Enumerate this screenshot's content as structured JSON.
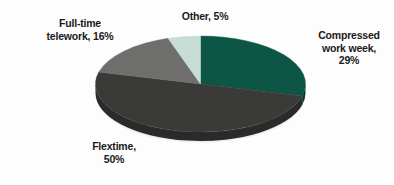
{
  "chart_data": {
    "type": "pie",
    "title": "",
    "subtitle": "",
    "xlabel": "",
    "ylabel": "",
    "legend_position": "none",
    "grid": false,
    "style": "3d-pie",
    "background_color": "#fdfdfd",
    "label_color": "#1a1a1a",
    "start_angle_deg": 0,
    "direction": "clockwise",
    "categories": [
      "Compressed work week",
      "Flextime",
      "Full-time telework",
      "Other"
    ],
    "values": [
      29,
      50,
      16,
      5
    ],
    "value_unit": "%",
    "colors": [
      "#0d5544",
      "#3a3a38",
      "#6e6e6c",
      "#c8dcd6"
    ],
    "side_colors": [
      "#083b30",
      "#2a2a28",
      "#4f4f4d",
      "#9fb3ad"
    ],
    "slices": [
      {
        "name": "Compressed work week",
        "value": 29,
        "label": "Compressed\nwork week,\n29%",
        "color": "#0d5544",
        "side_color": "#083b30"
      },
      {
        "name": "Flextime",
        "value": 50,
        "label": "Flextime,\n50%",
        "color": "#3a3a38",
        "side_color": "#2a2a28"
      },
      {
        "name": "Full-time telework",
        "value": 16,
        "label": "Full-time\ntelework, 16%",
        "color": "#6e6e6c",
        "side_color": "#4f4f4d"
      },
      {
        "name": "Other",
        "value": 5,
        "label": "Other, 5%",
        "color": "#c8dcd6",
        "side_color": "#9fb3ad"
      }
    ]
  },
  "labels": {
    "other": "Other, 5%",
    "telework": "Full-time\ntelework, 16%",
    "compressed": "Compressed\nwork week,\n29%",
    "flextime": "Flextime,\n50%"
  }
}
